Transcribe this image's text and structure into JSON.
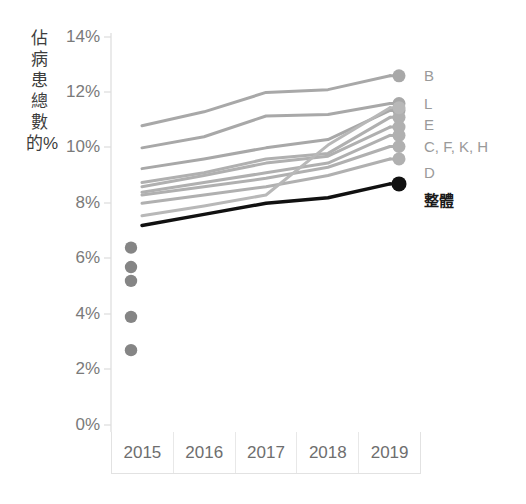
{
  "chart_data": {
    "type": "line",
    "title": "",
    "subtitle": "",
    "xlabel": "",
    "ylabel": "佔病患總數的%",
    "categories": [
      "2015",
      "2016",
      "2017",
      "2018",
      "2019"
    ],
    "x": [
      2015,
      2016,
      2017,
      2018,
      2019
    ],
    "ylim": [
      0,
      14
    ],
    "ytick_labels": [
      "0%",
      "2%",
      "4%",
      "6%",
      "8%",
      "10%",
      "12%",
      "14%"
    ],
    "ytick_values": [
      0,
      2,
      4,
      6,
      8,
      10,
      12,
      14
    ],
    "grid": false,
    "legend_position": "right-end-labels",
    "value_unit": "%",
    "series": [
      {
        "name": "B",
        "label": "B",
        "color": "#a8a8a8",
        "emphasis": false,
        "values": [
          10.8,
          11.3,
          12.0,
          12.1,
          12.6
        ]
      },
      {
        "name": "L",
        "label": "L",
        "color": "#a8a8a8",
        "emphasis": false,
        "values": [
          10.0,
          10.4,
          11.15,
          11.2,
          11.6
        ]
      },
      {
        "name": "E",
        "label": "E",
        "color": "#a8a8a8",
        "emphasis": false,
        "values": [
          9.25,
          9.6,
          10.0,
          10.3,
          11.35
        ]
      },
      {
        "name": "C",
        "label": "C, F, K, H",
        "color": "#b0b0b0",
        "emphasis": false,
        "values": [
          8.75,
          9.1,
          9.6,
          9.8,
          11.1
        ]
      },
      {
        "name": "F",
        "label": "",
        "color": "#b0b0b0",
        "emphasis": false,
        "values": [
          8.6,
          9.0,
          9.45,
          9.7,
          10.75
        ]
      },
      {
        "name": "K",
        "label": "",
        "color": "#b0b0b0",
        "emphasis": false,
        "values": [
          8.4,
          8.75,
          9.1,
          9.45,
          10.45
        ]
      },
      {
        "name": "H",
        "label": "",
        "color": "#b0b0b0",
        "emphasis": false,
        "values": [
          8.3,
          8.6,
          8.9,
          9.3,
          10.05
        ]
      },
      {
        "name": "D",
        "label": "D",
        "color": "#b0b0b0",
        "emphasis": false,
        "values": [
          8.0,
          8.3,
          8.6,
          9.0,
          9.6
        ]
      },
      {
        "name": "rising",
        "label": "",
        "color": "#b8b8b8",
        "emphasis": false,
        "values": [
          7.55,
          7.9,
          8.3,
          10.1,
          11.45
        ]
      },
      {
        "name": "整體",
        "label": "整體",
        "color": "#111111",
        "emphasis": true,
        "values": [
          7.2,
          7.6,
          8.0,
          8.2,
          8.7
        ]
      }
    ],
    "scatter_points_2015": [
      {
        "x": 2015,
        "y": 6.4
      },
      {
        "x": 2015,
        "y": 5.7
      },
      {
        "x": 2015,
        "y": 5.2
      },
      {
        "x": 2015,
        "y": 3.9
      },
      {
        "x": 2015,
        "y": 2.7
      }
    ],
    "colors": {
      "grey_series": "#b0b0b0",
      "emphasis_series": "#111111",
      "axis": "#dcdcdc",
      "tick_text": "#7a7a7a",
      "label_text": "#9a9a9a",
      "scatter_dot": "#858585"
    }
  },
  "axis": {
    "y_title": "佔病患總數的%",
    "y_ticks": [
      "14%",
      "12%",
      "10%",
      "8%",
      "6%",
      "4%",
      "2%",
      "0%"
    ],
    "x_years": [
      "2015",
      "2016",
      "2017",
      "2018",
      "2019"
    ]
  },
  "end_labels": [
    {
      "id": "B",
      "text": "B"
    },
    {
      "id": "L",
      "text": "L"
    },
    {
      "id": "E",
      "text": "E"
    },
    {
      "id": "CFKH",
      "text": "C, F, K, H"
    },
    {
      "id": "D",
      "text": "D"
    },
    {
      "id": "overall",
      "text": "整體"
    }
  ]
}
